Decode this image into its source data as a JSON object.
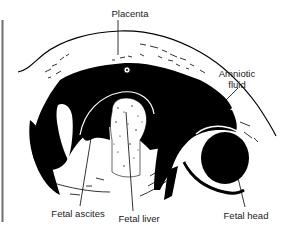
{
  "figure": {
    "type": "ultrasound-illustration",
    "colors": {
      "ink": "#000000",
      "background": "#ffffff",
      "frame_line": "#6e6e6e"
    }
  },
  "labels": {
    "placenta": "Placenta",
    "amniotic_fluid_line1": "Amniotic",
    "amniotic_fluid_line2": "fluid",
    "fetal_ascites": "Fetal ascites",
    "fetal_liver": "Fetal liver",
    "fetal_head": "Fetal head"
  }
}
